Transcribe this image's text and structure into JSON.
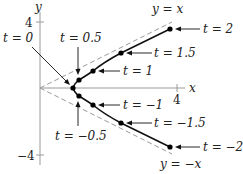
{
  "diagram": {
    "axes": {
      "x_label": "x",
      "y_label": "y",
      "x_tick": "4",
      "y_tick_top": "4",
      "y_tick_bottom": "−4"
    },
    "asymptotes": {
      "upper": "y = x",
      "lower": "y = −x"
    },
    "points": [
      {
        "t": "t = 2",
        "label": "t = 2"
      },
      {
        "t": "t = 1.5",
        "label": "t = 1.5"
      },
      {
        "t": "t = 1",
        "label": "t = 1"
      },
      {
        "t": "t = 0.5",
        "label": "t = 0.5"
      },
      {
        "t": "t = 0",
        "label": "t = 0"
      },
      {
        "t": "t = −0.5",
        "label": "t = −0.5"
      },
      {
        "t": "t = −1",
        "label": "t = −1"
      },
      {
        "t": "t = −1.5",
        "label": "t = −1.5"
      },
      {
        "t": "t = −2",
        "label": "t = −2"
      }
    ],
    "colors": {
      "curve": "#111111",
      "axis": "#9a9a9a",
      "asymptote": "#9a9a9a"
    }
  }
}
